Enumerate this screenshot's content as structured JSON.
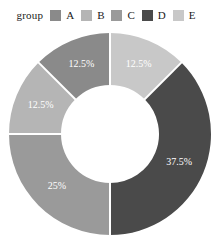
{
  "legend": {
    "title": "group",
    "items": [
      {
        "label": "A",
        "color": "#8a8a8a"
      },
      {
        "label": "B",
        "color": "#b5b5b5"
      },
      {
        "label": "C",
        "color": "#9a9a9a"
      },
      {
        "label": "D",
        "color": "#4a4a4a"
      },
      {
        "label": "E",
        "color": "#c8c8c8"
      }
    ]
  },
  "chart_data": {
    "type": "pie",
    "title": "",
    "legend_title": "group",
    "legend_position": "top",
    "donut": true,
    "inner_radius_ratio": 0.485,
    "start_angle_deg": 0,
    "direction": "clockwise",
    "categories": [
      "A",
      "B",
      "C",
      "D",
      "E"
    ],
    "values": [
      12.5,
      12.5,
      25,
      37.5,
      12.5
    ],
    "labels": [
      "12.5%",
      "12.5%",
      "25%",
      "37.5%",
      "12.5%"
    ],
    "colors": [
      "#8a8a8a",
      "#b5b5b5",
      "#9a9a9a",
      "#4a4a4a",
      "#c8c8c8"
    ],
    "slices": [
      {
        "category": "E",
        "value": 12.5,
        "label": "12.5%",
        "color": "#c8c8c8"
      },
      {
        "category": "D",
        "value": 37.5,
        "label": "37.5%",
        "color": "#4a4a4a"
      },
      {
        "category": "C",
        "value": 25,
        "label": "25%",
        "color": "#9a9a9a"
      },
      {
        "category": "B",
        "value": 12.5,
        "label": "12.5%",
        "color": "#b5b5b5"
      },
      {
        "category": "A",
        "value": 12.5,
        "label": "12.5%",
        "color": "#8a8a8a"
      }
    ],
    "separator_color": "#ffffff",
    "label_color": "#ffffff"
  },
  "geometry": {
    "cx": 110,
    "cy": 134,
    "outer_r": 101,
    "inner_r": 49,
    "label_r": 75
  }
}
